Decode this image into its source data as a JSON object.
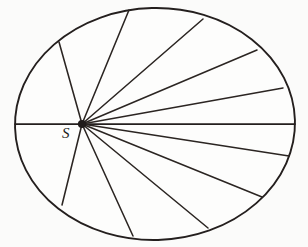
{
  "figure": {
    "caption_label": "S",
    "colors": {
      "paper": "#fbfbfa",
      "ink": "#241f1e",
      "chord_ink": "#2b2522"
    },
    "canvas": {
      "width": 308,
      "height": 247
    },
    "ellipse": {
      "cx": 155,
      "cy": 124,
      "rx": 140,
      "ry": 116
    },
    "point_s": {
      "x": 82,
      "y": 124,
      "label": "S"
    }
  },
  "chart_data": {
    "type": "diagram",
    "title": "",
    "subtitle": "",
    "xlabel": "",
    "ylabel": "",
    "grid": false,
    "legend": null,
    "shape": "ellipse",
    "ellipse": {
      "cx": 155,
      "cy": 124,
      "rx": 140,
      "ry": 116
    },
    "interior_point": {
      "name": "S",
      "x": 82,
      "y": 124
    },
    "annotations": [
      {
        "text": "S",
        "x": 68,
        "y": 138
      }
    ],
    "chord_count": 13,
    "chords": [
      {
        "id": "diameter-left",
        "x1": 15,
        "y1": 124,
        "x2": 82,
        "y2": 124
      },
      {
        "id": "diameter-right",
        "x1": 82,
        "y1": 124,
        "x2": 295,
        "y2": 124
      },
      {
        "id": "ul-steep",
        "x1": 82,
        "y1": 124,
        "x2": 59,
        "y2": 42
      },
      {
        "id": "ul-mid",
        "x1": 82,
        "y1": 124,
        "x2": 129,
        "y2": 10
      },
      {
        "id": "ur-1",
        "x1": 82,
        "y1": 124,
        "x2": 203,
        "y2": 19
      },
      {
        "id": "ur-2",
        "x1": 82,
        "y1": 124,
        "x2": 257,
        "y2": 50
      },
      {
        "id": "ur-3",
        "x1": 82,
        "y1": 124,
        "x2": 283,
        "y2": 88
      },
      {
        "id": "lr-1",
        "x1": 82,
        "y1": 124,
        "x2": 289,
        "y2": 156
      },
      {
        "id": "lr-2",
        "x1": 82,
        "y1": 124,
        "x2": 262,
        "y2": 197
      },
      {
        "id": "lr-3",
        "x1": 82,
        "y1": 124,
        "x2": 208,
        "y2": 228
      },
      {
        "id": "ll-1",
        "x1": 82,
        "y1": 124,
        "x2": 133,
        "y2": 236
      },
      {
        "id": "ll-steep",
        "x1": 82,
        "y1": 124,
        "x2": 62,
        "y2": 205
      }
    ]
  }
}
